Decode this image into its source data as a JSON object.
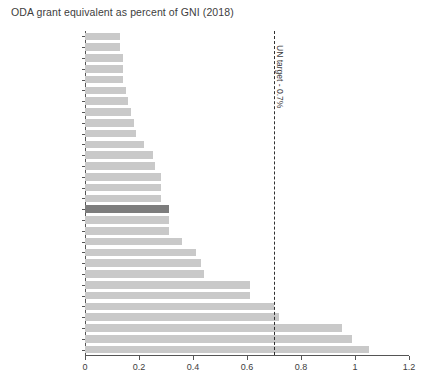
{
  "chart_data": {
    "type": "bar",
    "orientation": "horizontal",
    "title": "ODA grant equivalent as percent of GNI (2018)",
    "xlabel": "",
    "ylabel": "",
    "xlim": [
      0,
      1.2
    ],
    "xticks": [
      "0",
      "0.2",
      "0.4",
      "0.6",
      "0.8",
      "1",
      "1.2"
    ],
    "xtick_values": [
      0,
      0.2,
      0.4,
      0.6,
      0.8,
      1,
      1.2
    ],
    "grid": false,
    "legend": "none",
    "bar_color": "#c9c9c9",
    "highlight_color": "#7d7d7d",
    "highlight_category": "DAC total",
    "annotations": [
      {
        "label": "UN target - 0.7%",
        "value": 0.7,
        "style": "dashed-vertical-line",
        "color": "#2f2f2f"
      }
    ],
    "categories": [
      "Slovak Republic",
      "Greece",
      "Poland",
      "Hungary",
      "Czech Republic",
      "Korea",
      "Slovenia",
      "United States",
      "Portugal",
      "Spain",
      "Australia",
      "Italy",
      "Austria",
      "Japan",
      "Canada",
      "New Zealand",
      "DAC total",
      "Iceland",
      "Ireland",
      "Finland",
      "France",
      "Belgium",
      "Switzerland",
      "Netherlands",
      "Germany",
      "United Kingdom",
      "Denmark",
      "Norway",
      "Luxembourg",
      "Sweden"
    ],
    "values": [
      0.13,
      0.13,
      0.14,
      0.14,
      0.14,
      0.15,
      0.16,
      0.17,
      0.18,
      0.19,
      0.22,
      0.25,
      0.26,
      0.28,
      0.28,
      0.28,
      0.31,
      0.31,
      0.31,
      0.36,
      0.41,
      0.43,
      0.44,
      0.61,
      0.61,
      0.7,
      0.72,
      0.95,
      0.99,
      1.05
    ]
  }
}
